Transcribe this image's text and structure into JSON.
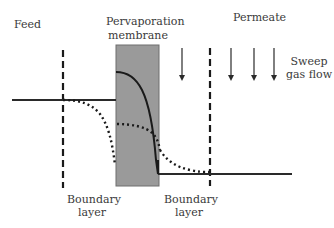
{
  "labels": {
    "feed": "Feed",
    "membrane_line1": "Pervaporation",
    "membrane_line2": "membrane",
    "permeate": "Permeate",
    "sweep_line1": "Sweep",
    "sweep_line2": "gas flow",
    "boundary_left_line1": "Boundary",
    "boundary_left_line2": "layer",
    "boundary_right_line1": "Boundary",
    "boundary_right_line2": "layer"
  },
  "colors": {
    "membrane_fill": "#9a9a9a",
    "membrane_stroke": "#6e6e6e",
    "line": "#1a1a1a",
    "text": "#3a3a3a"
  },
  "elements": {
    "membrane": {
      "x": 116,
      "y": 45,
      "w": 43,
      "h": 141
    },
    "left_boundary_x": 63,
    "right_boundary_x": 210,
    "arrows_x": [
      182,
      231,
      254,
      274
    ]
  }
}
